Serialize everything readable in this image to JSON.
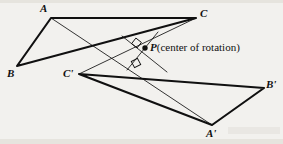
{
  "figure": {
    "type": "geometry-diagram",
    "background_color": "#f2f1ee",
    "ink_color": "#101010",
    "points": {
      "A": {
        "label": "A",
        "x": 51,
        "y": 18,
        "label_x": 40,
        "label_y": 3
      },
      "B": {
        "label": "B",
        "x": 17,
        "y": 66,
        "label_x": 7,
        "label_y": 68
      },
      "C": {
        "label": "C",
        "x": 196,
        "y": 18,
        "label_x": 200,
        "label_y": 8
      },
      "Ap": {
        "label": "A'",
        "x": 212,
        "y": 125,
        "label_x": 207,
        "label_y": 128
      },
      "Bp": {
        "label": "B'",
        "x": 264,
        "y": 88,
        "label_x": 266,
        "label_y": 79
      },
      "Cp": {
        "label": "C'",
        "x": 79,
        "y": 74,
        "label_x": 64,
        "label_y": 68
      },
      "P": {
        "label": "P",
        "x": 145,
        "y": 48,
        "label_x": 150,
        "label_y": 42
      }
    },
    "center_label": {
      "name": "P",
      "description": "(center of rotation)",
      "full_text": "P(center of rotation)"
    },
    "triangles": [
      {
        "name": "ABC",
        "vertices": [
          "A",
          "B",
          "C"
        ],
        "stroke_width": 2.1
      },
      {
        "name": "A'B'C'",
        "vertices": [
          "Ap",
          "Bp",
          "Cp"
        ],
        "stroke_width": 2.1
      }
    ],
    "correspondence_segments": [
      {
        "name": "A-to-A'",
        "from": "A",
        "to": "Ap",
        "stroke_width": 0.8
      },
      {
        "name": "C-to-C'",
        "from": "C",
        "to": "Cp",
        "stroke_width": 0.8
      }
    ],
    "perpendicular_bisectors": [
      {
        "name": "bisector-of-AA'",
        "x1": 158,
        "y1": 32,
        "x2": 127,
        "y2": 70,
        "stroke_width": 0.8
      },
      {
        "name": "bisector-of-CC'",
        "x1": 167,
        "y1": 72,
        "x2": 122,
        "y2": 36,
        "stroke_width": 0.8
      }
    ],
    "right_angle_marks": [
      {
        "name": "right-angle-mark-upper",
        "cx": 136,
        "cy": 43,
        "size": 7,
        "rotation": 38
      },
      {
        "name": "right-angle-mark-lower",
        "cx": 136,
        "cy": 63,
        "size": 7,
        "rotation": -28
      }
    ],
    "center_dot": {
      "name": "center-point-P",
      "cx": 145,
      "cy": 48,
      "r": 2.6
    }
  }
}
